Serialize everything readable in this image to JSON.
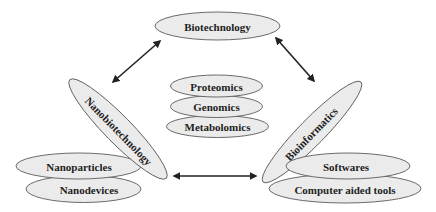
{
  "diagram": {
    "type": "concept-map",
    "colors": {
      "node_fill": "#ebebeb",
      "node_stroke": "#5a5a5a",
      "text": "#1e1e1e",
      "arrow": "#222222"
    },
    "nodes": {
      "biotechnology": {
        "label": "Biotechnology"
      },
      "nanobiotechnology": {
        "label": "Nanobiotechnology"
      },
      "bioinformatics": {
        "label": "Bioinformatics"
      },
      "proteomics": {
        "label": "Proteomics"
      },
      "genomics": {
        "label": "Genomics"
      },
      "metabolomics": {
        "label": "Metabolomics"
      },
      "nanoparticles": {
        "label": "Nanoparticles"
      },
      "nanodevices": {
        "label": "Nanodevices"
      },
      "softwares": {
        "label": "Softwares"
      },
      "computer_aided_tools": {
        "label": "Computer aided tools"
      }
    },
    "edges": [
      {
        "from": "Biotechnology",
        "to": "Nanobiotechnology",
        "style": "bidirectional-arrow"
      },
      {
        "from": "Biotechnology",
        "to": "Bioinformatics",
        "style": "bidirectional-arrow"
      },
      {
        "from": "Nanobiotechnology",
        "to": "Bioinformatics",
        "style": "bidirectional-arrow"
      }
    ],
    "groups": {
      "center": [
        "Proteomics",
        "Genomics",
        "Metabolomics"
      ],
      "nanobiotechnology_children": [
        "Nanoparticles",
        "Nanodevices"
      ],
      "bioinformatics_children": [
        "Softwares",
        "Computer aided tools"
      ]
    }
  }
}
